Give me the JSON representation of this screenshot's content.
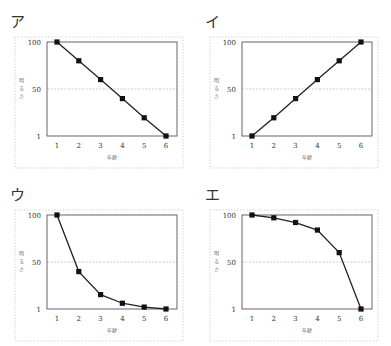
{
  "chart_data": [
    {
      "type": "line",
      "panel_label": "ア",
      "title": "",
      "xlabel": "年齢",
      "ylabel": "明るさ",
      "x": [
        1,
        2,
        3,
        4,
        5,
        6
      ],
      "values": [
        100,
        80,
        60,
        40,
        20,
        1
      ],
      "yticks": [
        1,
        50,
        100
      ],
      "xticks": [
        1,
        2,
        3,
        4,
        5,
        6
      ],
      "ylim": [
        1,
        100
      ],
      "grid": "dashed line at 50",
      "marker": "square"
    },
    {
      "type": "line",
      "panel_label": "イ",
      "title": "",
      "xlabel": "年齢",
      "ylabel": "明るさ",
      "x": [
        1,
        2,
        3,
        4,
        5,
        6
      ],
      "values": [
        1,
        20,
        40,
        60,
        80,
        100
      ],
      "yticks": [
        1,
        50,
        100
      ],
      "xticks": [
        1,
        2,
        3,
        4,
        5,
        6
      ],
      "ylim": [
        1,
        100
      ],
      "grid": "dashed line at 50",
      "marker": "square"
    },
    {
      "type": "line",
      "panel_label": "ウ",
      "title": "",
      "xlabel": "年齢",
      "ylabel": "明るさ",
      "x": [
        1,
        2,
        3,
        4,
        5,
        6
      ],
      "values": [
        100,
        40,
        16,
        7,
        3,
        1
      ],
      "yticks": [
        1,
        50,
        100
      ],
      "xticks": [
        1,
        2,
        3,
        4,
        5,
        6
      ],
      "ylim": [
        1,
        100
      ],
      "grid": "dashed line at 50",
      "marker": "square"
    },
    {
      "type": "line",
      "panel_label": "エ",
      "title": "",
      "xlabel": "年齢",
      "ylabel": "明るさ",
      "x": [
        1,
        2,
        3,
        4,
        5,
        6
      ],
      "values": [
        100,
        97,
        92,
        84,
        60,
        1
      ],
      "yticks": [
        1,
        50,
        100
      ],
      "xticks": [
        1,
        2,
        3,
        4,
        5,
        6
      ],
      "ylim": [
        1,
        100
      ],
      "grid": "dashed line at 50",
      "marker": "square"
    }
  ]
}
